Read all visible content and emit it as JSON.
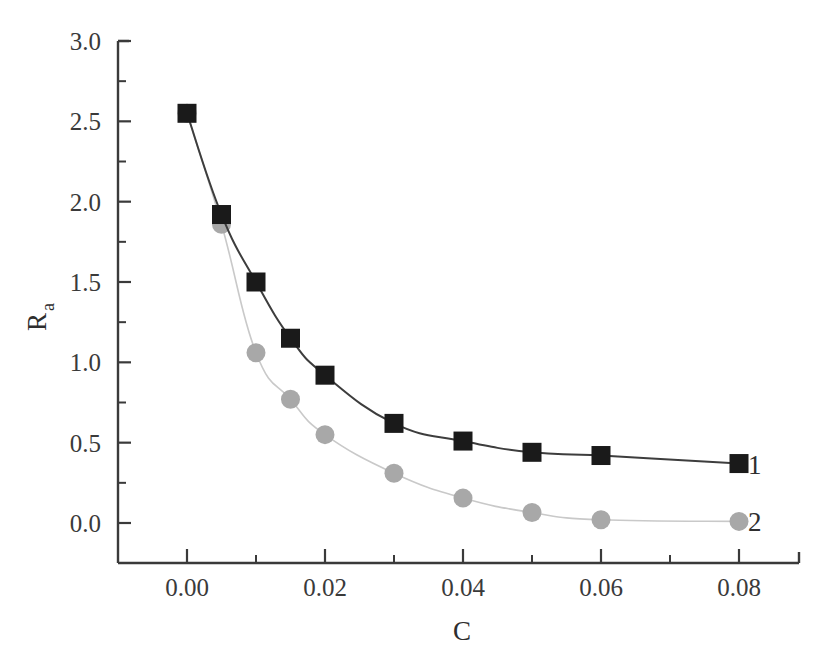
{
  "chart_data": {
    "type": "line",
    "title": "",
    "subtitle": "",
    "xlabel": "C",
    "ylabel": "R",
    "ylabel_subscript": "a",
    "xlim": [
      -0.005,
      0.0895
    ],
    "ylim": [
      -0.25,
      3.0
    ],
    "xticks": [
      0.0,
      0.02,
      0.04,
      0.06,
      0.08
    ],
    "xtick_labels": [
      "0.00",
      "0.02",
      "0.04",
      "0.06",
      "0.08"
    ],
    "xminor_ticks": [
      0.01,
      0.03,
      0.05,
      0.07
    ],
    "yticks": [
      0.0,
      0.5,
      1.0,
      1.5,
      2.0,
      2.5,
      3.0
    ],
    "ytick_labels": [
      "0.0",
      "0.5",
      "1.0",
      "1.5",
      "2.0",
      "2.5",
      "3.0"
    ],
    "yminor_ticks": [
      0.25,
      0.75,
      1.25,
      1.75,
      2.25,
      2.75
    ],
    "grid": false,
    "legend_position": "inline-right-end",
    "x": [
      0.0,
      0.005,
      0.01,
      0.015,
      0.02,
      0.03,
      0.04,
      0.05,
      0.06,
      0.08
    ],
    "series": [
      {
        "name": "1",
        "label": "1",
        "marker": "square",
        "color": "#1a1a1a",
        "line_color": "#3d3d3d",
        "values": [
          2.55,
          1.92,
          1.5,
          1.15,
          0.92,
          0.62,
          0.51,
          0.44,
          0.42,
          0.37
        ]
      },
      {
        "name": "2",
        "label": "2",
        "marker": "circle",
        "color": "#a8a8a8",
        "line_color": "#c9c9c9",
        "values": [
          2.55,
          1.86,
          1.06,
          0.77,
          0.55,
          0.31,
          0.155,
          0.065,
          0.02,
          0.01
        ]
      }
    ],
    "colors": {
      "axis": "#3a3a3a",
      "background": "#ffffff",
      "series1": "#1a1a1a",
      "series2": "#a8a8a8"
    }
  }
}
